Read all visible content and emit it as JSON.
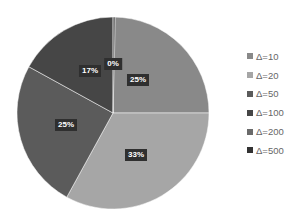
{
  "chart_data": {
    "type": "pie",
    "title": "",
    "categories": [
      "Δ=10",
      "Δ=20",
      "Δ=50",
      "Δ=100",
      "Δ=200",
      "Δ=500"
    ],
    "values": [
      25,
      33,
      25,
      17,
      0,
      0
    ],
    "labels": [
      "25%",
      "33%",
      "25%",
      "17%",
      "0%",
      ""
    ],
    "colors": [
      "#898989",
      "#a6a6a6",
      "#5b5b5b",
      "#464646",
      "#6a6a6a",
      "#333333"
    ],
    "start_angle_deg": 0,
    "direction": "clockwise",
    "legend_position": "right",
    "data_labels": true
  },
  "legend": {
    "items": [
      {
        "label": "Δ=10",
        "color": "#898989"
      },
      {
        "label": "Δ=20",
        "color": "#a6a6a6"
      },
      {
        "label": "Δ=50",
        "color": "#5b5b5b"
      },
      {
        "label": "Δ=100",
        "color": "#464646"
      },
      {
        "label": "Δ=200",
        "color": "#6a6a6a"
      },
      {
        "label": "Δ=500",
        "color": "#333333"
      }
    ]
  },
  "data_labels": {
    "slice0": "25%",
    "slice1": "33%",
    "slice2": "25%",
    "slice3": "17%",
    "slice4": "0%"
  }
}
